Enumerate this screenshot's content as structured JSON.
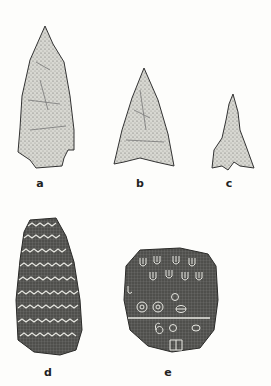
{
  "figure": {
    "artifacts": [
      {
        "id": "a",
        "label": "a",
        "kind": "stemmed projectile point",
        "label_pos": [
          40,
          177
        ]
      },
      {
        "id": "b",
        "label": "b",
        "kind": "triangular projectile point",
        "label_pos": [
          140,
          177
        ]
      },
      {
        "id": "c",
        "label": "c",
        "kind": "small barbed projectile point",
        "label_pos": [
          229,
          177
        ]
      },
      {
        "id": "d",
        "label": "d",
        "kind": "incised stone with zigzag bands",
        "label_pos": [
          48,
          366
        ]
      },
      {
        "id": "e",
        "label": "e",
        "kind": "engraved stone tablet with symbols",
        "label_pos": [
          168,
          366
        ]
      }
    ],
    "colors": {
      "background": "#fdfdfb",
      "stipple": "#6a6a66",
      "stone": "#4a4a48",
      "incision": "#e8e8e2"
    }
  }
}
